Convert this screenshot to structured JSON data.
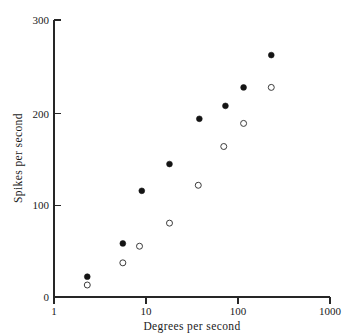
{
  "chart_data": {
    "type": "scatter",
    "title": "",
    "xlabel": "Degrees per second",
    "ylabel": "Spikes per second",
    "xscale": "log",
    "yscale": "linear",
    "xlim": [
      1,
      1000
    ],
    "ylim": [
      0,
      300
    ],
    "xticks": [
      1,
      10,
      100,
      1000
    ],
    "xticklabels": [
      "1",
      "10",
      "100",
      "1000"
    ],
    "yticks": [
      0,
      100,
      200,
      300
    ],
    "yticklabels": [
      "0",
      "100",
      "200",
      "300"
    ],
    "grid": false,
    "legend": "none",
    "series": [
      {
        "name": "filled",
        "marker": "filled-circle",
        "color": "#141414",
        "points": [
          {
            "x": 2.3,
            "y": 22
          },
          {
            "x": 5.6,
            "y": 58
          },
          {
            "x": 9.0,
            "y": 115
          },
          {
            "x": 18.0,
            "y": 144
          },
          {
            "x": 38.0,
            "y": 193
          },
          {
            "x": 73.0,
            "y": 207
          },
          {
            "x": 115.0,
            "y": 227
          },
          {
            "x": 230.0,
            "y": 262
          }
        ]
      },
      {
        "name": "open",
        "marker": "open-circle",
        "color": "#3c3c3c",
        "points": [
          {
            "x": 2.3,
            "y": 13
          },
          {
            "x": 5.6,
            "y": 37
          },
          {
            "x": 8.5,
            "y": 55
          },
          {
            "x": 18.0,
            "y": 80
          },
          {
            "x": 37.0,
            "y": 121
          },
          {
            "x": 70.0,
            "y": 163
          },
          {
            "x": 115.0,
            "y": 188
          },
          {
            "x": 230.0,
            "y": 227
          }
        ]
      }
    ]
  },
  "axes": {
    "x_title": "Degrees per second",
    "y_title": "Spikes per second",
    "x_tick_labels": [
      "1",
      "10",
      "100",
      "1000"
    ],
    "y_tick_labels": [
      "0",
      "100",
      "200",
      "300"
    ]
  }
}
